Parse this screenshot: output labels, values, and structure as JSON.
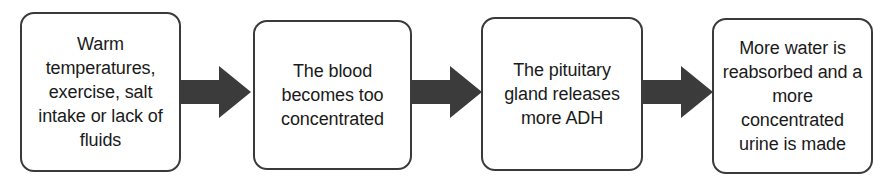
{
  "diagram": {
    "type": "linear-flowchart",
    "orientation": "left-to-right",
    "background_color": "#ffffff",
    "box_border_color": "#3a3a3a",
    "box_fill_color": "#ffffff",
    "arrow_color": "#3b3b3b",
    "text_color": "#1a1a1a",
    "nodes": [
      {
        "id": "stimulus",
        "text": "Warm temperatures, exercise, salt intake or lack of fluids"
      },
      {
        "id": "blood-concentrated",
        "text": "The blood becomes too concentrated"
      },
      {
        "id": "pituitary-adh",
        "text": "The pituitary gland releases more ADH"
      },
      {
        "id": "water-reabsorbed",
        "text": "More water is reabsorbed and a more concentrated urine is made"
      }
    ],
    "connectors": [
      {
        "id": "arrow-1",
        "from": "stimulus",
        "to": "blood-concentrated",
        "shape": "block-arrow-right"
      },
      {
        "id": "arrow-2",
        "from": "blood-concentrated",
        "to": "pituitary-adh",
        "shape": "block-arrow-right"
      },
      {
        "id": "arrow-3",
        "from": "pituitary-adh",
        "to": "water-reabsorbed",
        "shape": "block-arrow-right"
      }
    ]
  }
}
